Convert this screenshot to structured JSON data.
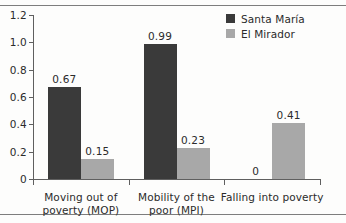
{
  "chart_data": {
    "type": "bar",
    "title": "",
    "subtitle": "",
    "xlabel": "",
    "ylabel": "",
    "ylim": [
      0,
      1.2
    ],
    "yticks": [
      "0",
      "0.2",
      "0.4",
      "0.6",
      "0.8",
      "1.0",
      "1.2"
    ],
    "ytick_values": [
      0,
      0.2,
      0.4,
      0.6,
      0.8,
      1.0,
      1.2
    ],
    "grid": false,
    "legend_position": "top-right",
    "categories": [
      "Moving out of poverty (MOP)",
      "Mobility of the poor (MPI)",
      "Falling into poverty"
    ],
    "category_lines": [
      [
        "Moving out of",
        "poverty (MOP)"
      ],
      [
        "Mobility of the",
        "poor (MPI)"
      ],
      [
        "Falling into poverty"
      ]
    ],
    "series": [
      {
        "name": "Santa María",
        "color": "#3a3a3a",
        "values": [
          0.67,
          0.99,
          0
        ],
        "labels": [
          "0.67",
          "0.99",
          "0"
        ]
      },
      {
        "name": "El Mirador",
        "color": "#a8a8a8",
        "values": [
          0.15,
          0.23,
          0.41
        ],
        "labels": [
          "0.15",
          "0.23",
          "0.41"
        ]
      }
    ]
  },
  "legend": {
    "items": [
      {
        "label": "Santa María",
        "swatch": "dark-square-swatch"
      },
      {
        "label": "El Mirador",
        "swatch": "gray-square-swatch"
      }
    ]
  },
  "colors": {
    "series_dark": "#3a3a3a",
    "series_light": "#a8a8a8",
    "axis": "#5f5f5f",
    "rule": "#7d7d7d",
    "text": "#2b2b2b",
    "background": "#fdfdfc"
  }
}
